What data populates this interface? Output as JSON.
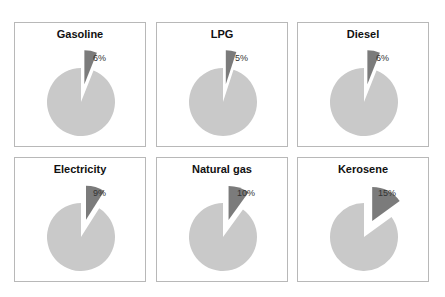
{
  "chart_data": {
    "type": "pie",
    "layout": "small-multiples 3x2",
    "colors": {
      "remainder": "#c9c9c9",
      "highlight": "#7b7b7b",
      "border": "#b8b8b8"
    },
    "panels": [
      {
        "title": "Gasoline",
        "value": 6,
        "label": "6%"
      },
      {
        "title": "LPG",
        "value": 5,
        "label": "5%"
      },
      {
        "title": "Diesel",
        "value": 6,
        "label": "6%"
      },
      {
        "title": "Electricity",
        "value": 9,
        "label": "9%"
      },
      {
        "title": "Natural gas",
        "value": 10,
        "label": "10%"
      },
      {
        "title": "Kerosene",
        "value": 15,
        "label": "15%"
      }
    ]
  }
}
